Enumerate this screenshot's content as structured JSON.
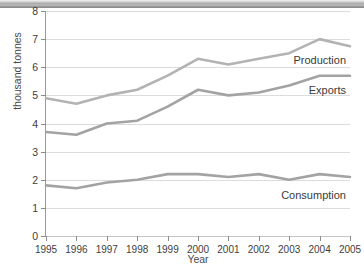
{
  "titlebar": {
    "caption": ""
  },
  "chart_data": {
    "type": "line",
    "title": "",
    "xlabel": "Year",
    "ylabel": "thousand tonnes",
    "categories": [
      "1995",
      "1996",
      "1997",
      "1998",
      "1999",
      "2000",
      "2001",
      "2002",
      "2003",
      "2004",
      "2005"
    ],
    "x": [
      1995,
      1996,
      1997,
      1998,
      1999,
      2000,
      2001,
      2002,
      2003,
      2004,
      2005
    ],
    "xlim": [
      1995,
      2005
    ],
    "ylim": [
      0,
      8
    ],
    "yticks": [
      0,
      1,
      2,
      3,
      4,
      5,
      6,
      7,
      8
    ],
    "ytick_labels": [
      "0",
      "1",
      "2",
      "3",
      "4",
      "5",
      "6",
      "7",
      "8"
    ],
    "grid": "horizontal",
    "legend": "inline-labels",
    "series": [
      {
        "name": "Production",
        "color": "#b3b3b3",
        "label": "Production",
        "values": [
          4.9,
          4.7,
          5.0,
          5.2,
          5.7,
          6.3,
          6.1,
          6.3,
          6.5,
          7.0,
          6.75
        ]
      },
      {
        "name": "Exports",
        "color": "#a3a3a3",
        "label": "Exports",
        "values": [
          3.7,
          3.6,
          4.0,
          4.1,
          4.6,
          5.2,
          5.0,
          5.1,
          5.35,
          5.7,
          5.7
        ]
      },
      {
        "name": "Consumption",
        "color": "#a3a3a3",
        "label": "Consumption",
        "values": [
          1.8,
          1.7,
          1.9,
          2.0,
          2.2,
          2.2,
          2.1,
          2.2,
          2.0,
          2.2,
          2.1
        ]
      }
    ],
    "annotations": [
      {
        "text": "Production",
        "series": "Production"
      },
      {
        "text": "Exports",
        "series": "Exports"
      },
      {
        "text": "Consumption",
        "series": "Consumption"
      }
    ],
    "colors": {
      "gridline": "#dcdcdc",
      "axis": "#9a9a9a",
      "tick_text": "#3d3d3d",
      "label_text": "#4a4a4a",
      "background": "#ffffff"
    }
  }
}
